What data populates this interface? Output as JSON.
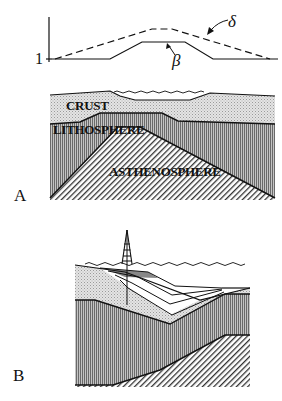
{
  "figure": {
    "panels": [
      {
        "id": "A",
        "letter": "A",
        "graph": {
          "axis_tick_label": "1",
          "series": [
            {
              "name": "delta",
              "symbol": "δ",
              "style": "dashed"
            },
            {
              "name": "beta",
              "symbol": "β",
              "style": "solid"
            }
          ]
        },
        "layers": [
          {
            "name": "crust",
            "label": "CRUST"
          },
          {
            "name": "lithosphere",
            "label": "LITHOSPHERE"
          },
          {
            "name": "asthenosphere",
            "label": "ASTHENOSPHERE"
          }
        ]
      },
      {
        "id": "B",
        "letter": "B",
        "elements": [
          "sea-surface",
          "drilling-rig",
          "sedimentary-basin-layers",
          "crust",
          "lithosphere",
          "asthenosphere"
        ]
      }
    ],
    "colors": {
      "ink": "#111111",
      "crust_fill": "#d8d8d8",
      "lithosphere_fill": "#9a9a9a",
      "asthenosphere_fill": "#ffffff",
      "background": "#ffffff"
    }
  }
}
